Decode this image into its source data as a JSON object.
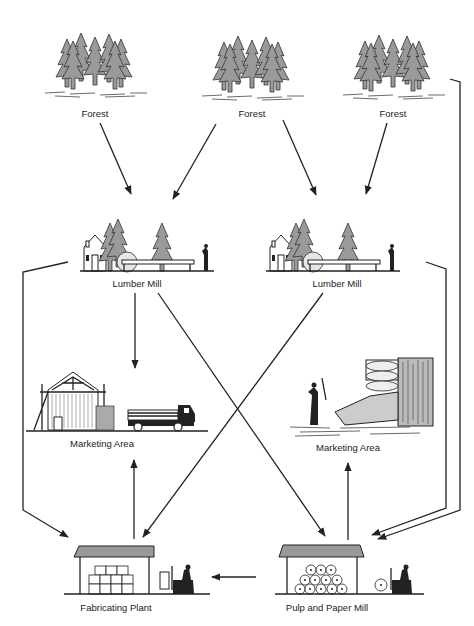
{
  "nodes": {
    "forest_1": {
      "label": "Forest"
    },
    "forest_2": {
      "label": "Forest"
    },
    "forest_3": {
      "label": "Forest"
    },
    "lumber_mill_1": {
      "label": "Lumber Mill"
    },
    "lumber_mill_2": {
      "label": "Lumber Mill"
    },
    "marketing_area_1": {
      "label": "Marketing Area"
    },
    "marketing_area_2": {
      "label": "Marketing Area"
    },
    "fabricating_plant": {
      "label": "Fabricating Plant"
    },
    "pulp_paper_mill": {
      "label": "Pulp and Paper Mill"
    }
  },
  "edges": [
    {
      "from": "forest_1",
      "to": "lumber_mill_1"
    },
    {
      "from": "forest_2",
      "to": "lumber_mill_1"
    },
    {
      "from": "forest_2",
      "to": "lumber_mill_2"
    },
    {
      "from": "forest_3",
      "to": "lumber_mill_2"
    },
    {
      "from": "forest_3",
      "to": "pulp_paper_mill"
    },
    {
      "from": "lumber_mill_1",
      "to": "marketing_area_1"
    },
    {
      "from": "lumber_mill_1",
      "to": "fabricating_plant"
    },
    {
      "from": "lumber_mill_1",
      "to": "pulp_paper_mill"
    },
    {
      "from": "lumber_mill_2",
      "to": "fabricating_plant"
    },
    {
      "from": "lumber_mill_2",
      "to": "pulp_paper_mill"
    },
    {
      "from": "fabricating_plant",
      "to": "marketing_area_1"
    },
    {
      "from": "pulp_paper_mill",
      "to": "marketing_area_2"
    },
    {
      "from": "pulp_paper_mill",
      "to": "fabricating_plant"
    }
  ]
}
